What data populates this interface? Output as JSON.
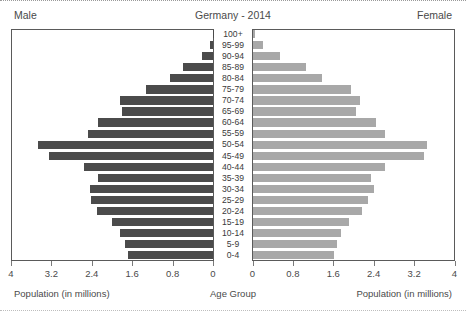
{
  "header": {
    "left_label": "Male",
    "title": "Germany - 2014",
    "right_label": "Female"
  },
  "footer": {
    "left_caption": "Population (in millions)",
    "center_caption": "Age Group",
    "right_caption": "Population (in millions)"
  },
  "colors": {
    "male_bar": "#4b4b4b",
    "female_bar": "#a8a8a8",
    "axis": "#5a5a5a",
    "text": "#3a3a3a"
  },
  "chart_data": {
    "type": "bar",
    "subtype": "population-pyramid",
    "title": "Germany - 2014",
    "xlabel": "Population (in millions)",
    "ylabel": "Age Group",
    "xlim": [
      0,
      4
    ],
    "xticks": [
      0,
      0.8,
      1.6,
      2.4,
      3.2,
      4
    ],
    "xticklabels": [
      "0",
      "0.8",
      "1.6",
      "2.4",
      "3.2",
      "4"
    ],
    "grid": false,
    "legend": [
      "Male",
      "Female"
    ],
    "legend_position": "top-outside",
    "categories": [
      "100+",
      "95-99",
      "90-94",
      "85-89",
      "80-84",
      "75-79",
      "70-74",
      "65-69",
      "60-64",
      "55-59",
      "50-54",
      "45-49",
      "40-44",
      "35-39",
      "30-34",
      "25-29",
      "20-24",
      "15-19",
      "10-14",
      "5-9",
      "0-4"
    ],
    "series": [
      {
        "name": "Male",
        "side": "left",
        "color": "#4b4b4b",
        "values": [
          0.01,
          0.06,
          0.21,
          0.59,
          0.86,
          1.32,
          1.85,
          1.81,
          2.28,
          2.47,
          3.46,
          3.24,
          2.55,
          2.28,
          2.43,
          2.41,
          2.29,
          2.0,
          1.84,
          1.75,
          1.69
        ]
      },
      {
        "name": "Female",
        "side": "right",
        "color": "#a8a8a8",
        "values": [
          0.04,
          0.19,
          0.53,
          1.05,
          1.36,
          1.95,
          2.11,
          2.03,
          2.43,
          2.62,
          3.44,
          3.38,
          2.62,
          2.33,
          2.4,
          2.27,
          2.15,
          1.9,
          1.75,
          1.66,
          1.61
        ]
      }
    ]
  }
}
